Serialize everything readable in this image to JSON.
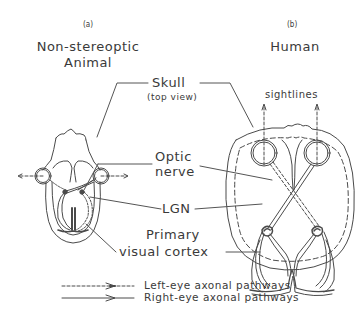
{
  "panels": {
    "a": {
      "tag": "(a)",
      "title_line1": "Non-stereoptic",
      "title_line2": "Animal"
    },
    "b": {
      "tag": "(b)",
      "title": "Human"
    }
  },
  "labels": {
    "skull": "Skull",
    "skull_sub": "(top view)",
    "optic_line1": "Optic",
    "optic_line2": "nerve",
    "lgn": "LGN",
    "cortex_line1": "Primary",
    "cortex_line2": "visual cortex",
    "sightlines": "sightlines"
  },
  "legend": [
    {
      "style": "dashed",
      "label": "Left-eye axonal pathways"
    },
    {
      "style": "solid",
      "label": "Right-eye axonal pathways"
    }
  ],
  "colors": {
    "line": "#4a4a4a",
    "text": "#3a3a3a",
    "background": "#ffffff"
  }
}
